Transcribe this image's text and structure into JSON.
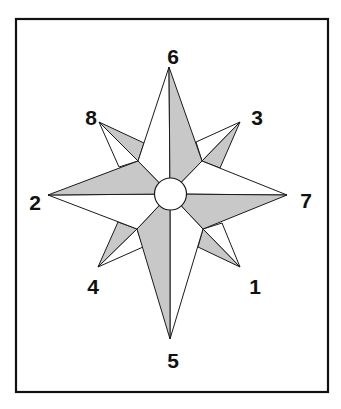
{
  "figure": {
    "type": "compass-rose",
    "colors": {
      "shade": "#c8c8c8",
      "light": "#ffffff",
      "line": "#1a1a1a",
      "frame": "#111111"
    },
    "frame": {
      "x": 16,
      "y": 19,
      "w": 312,
      "h": 373
    },
    "hub": {
      "cx": 170.5,
      "cy": 194,
      "r": 16
    },
    "labels": [
      {
        "id": "6",
        "text": "6",
        "x": 173,
        "y": 64
      },
      {
        "id": "8",
        "text": "8",
        "x": 91,
        "y": 125
      },
      {
        "id": "3",
        "text": "3",
        "x": 257,
        "y": 125
      },
      {
        "id": "2",
        "text": "2",
        "x": 35,
        "y": 210
      },
      {
        "id": "7",
        "text": "7",
        "x": 306,
        "y": 208
      },
      {
        "id": "4",
        "text": "4",
        "x": 93,
        "y": 294
      },
      {
        "id": "1",
        "text": "1",
        "x": 255,
        "y": 294
      },
      {
        "id": "5",
        "text": "5",
        "x": 173,
        "y": 368
      }
    ],
    "polygons": [
      {
        "name": "nw-diagonal-gray",
        "fill": "shade",
        "points": "99,122 144,143 138,161"
      },
      {
        "name": "nw-diagonal-white",
        "fill": "light",
        "points": "99,122 138,161 119,167"
      },
      {
        "name": "ne-diagonal-white",
        "fill": "light",
        "points": "240,122 196,142 202,161"
      },
      {
        "name": "ne-diagonal-gray",
        "fill": "shade",
        "points": "240,122 202,161 220,168"
      },
      {
        "name": "sw-diagonal-gray",
        "fill": "shade",
        "points": "98,267 118,222 137,229"
      },
      {
        "name": "sw-diagonal-white",
        "fill": "light",
        "points": "98,267 137,229 143,247"
      },
      {
        "name": "se-diagonal-white",
        "fill": "light",
        "points": "240,267 222,223 203,229"
      },
      {
        "name": "se-diagonal-gray",
        "fill": "shade",
        "points": "240,267 203,229 198,247"
      },
      {
        "name": "north-left-white",
        "fill": "light",
        "points": "169,67 138,161 170,194"
      },
      {
        "name": "north-right-gray",
        "fill": "shade",
        "points": "169,67 170,194 202,161"
      },
      {
        "name": "east-upper-white",
        "fill": "light",
        "points": "287,195 202,161 170,194"
      },
      {
        "name": "east-lower-gray",
        "fill": "shade",
        "points": "287,195 170,194 203,229"
      },
      {
        "name": "south-right-white",
        "fill": "light",
        "points": "170,339 203,229 170,194"
      },
      {
        "name": "south-left-gray",
        "fill": "shade",
        "points": "170,339 170,194 137,229"
      },
      {
        "name": "west-lower-white",
        "fill": "light",
        "points": "48,195 137,229 170,194"
      },
      {
        "name": "west-upper-gray",
        "fill": "shade",
        "points": "48,195 170,194 138,161"
      }
    ]
  }
}
